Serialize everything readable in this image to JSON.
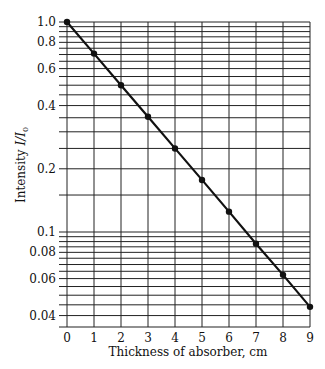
{
  "chart_data": {
    "type": "line",
    "title": "",
    "xlabel": "Thickness of absorber, cm",
    "ylabel": "Intensity I/I0",
    "ylabel_main": "Intensity ",
    "ylabel_italic": "I/I",
    "ylabel_sub": "0",
    "yscale": "log",
    "xlim": [
      0,
      9
    ],
    "ylim": [
      0.035,
      1.0
    ],
    "grid": true,
    "x_ticks": [
      0,
      1,
      2,
      3,
      4,
      5,
      6,
      7,
      8,
      9
    ],
    "y_tick_labels": [
      {
        "value": 1.0,
        "label": "1.0"
      },
      {
        "value": 0.8,
        "label": "0.8"
      },
      {
        "value": 0.6,
        "label": "0.6"
      },
      {
        "value": 0.4,
        "label": "0.4"
      },
      {
        "value": 0.2,
        "label": "0.2"
      },
      {
        "value": 0.1,
        "label": "0.1"
      },
      {
        "value": 0.08,
        "label": "0.08"
      },
      {
        "value": 0.06,
        "label": "0.06"
      },
      {
        "value": 0.04,
        "label": "0.04"
      }
    ],
    "series": [
      {
        "name": "Intensity",
        "x": [
          0,
          1,
          2,
          3,
          4,
          5,
          6,
          7,
          8,
          9
        ],
        "y": [
          1.0,
          0.707,
          0.5,
          0.354,
          0.25,
          0.177,
          0.125,
          0.088,
          0.0625,
          0.044
        ],
        "marker": "circle",
        "color": "#111111"
      }
    ]
  }
}
